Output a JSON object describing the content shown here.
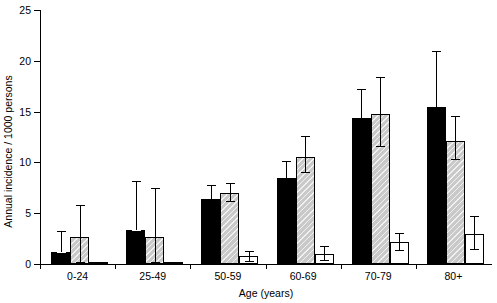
{
  "chart_data": {
    "type": "bar",
    "title": "",
    "xlabel": "Age (years)",
    "ylabel": "Annual incidence / 1000 persons",
    "categories": [
      "0-24",
      "25-49",
      "50-59",
      "60-69",
      "70-79",
      "80+"
    ],
    "ylim": [
      0,
      25
    ],
    "yticks": [
      0,
      5,
      10,
      15,
      20,
      25
    ],
    "ytick_labels": [
      "0",
      "5",
      "10",
      "15",
      "20",
      "25"
    ],
    "grid": false,
    "legend": "none",
    "series": [
      {
        "name": "series-1-black",
        "fill": "#000000",
        "values": [
          1.2,
          3.3,
          6.4,
          8.5,
          14.4,
          15.5
        ],
        "err_low": [
          1.2,
          3.3,
          5.7,
          7.5,
          13.0,
          13.2
        ],
        "err_high": [
          3.2,
          8.2,
          7.8,
          10.1,
          17.2,
          21.0
        ]
      },
      {
        "name": "series-2-gray-hatched",
        "fill": "#c9c9c9",
        "values": [
          2.7,
          2.7,
          7.0,
          10.5,
          14.8,
          12.1
        ],
        "err_low": [
          0.2,
          0.2,
          6.2,
          9.1,
          11.6,
          10.3
        ],
        "err_high": [
          5.8,
          7.5,
          8.0,
          12.6,
          18.4,
          14.6
        ]
      },
      {
        "name": "series-3-white",
        "fill": "#ffffff",
        "values": [
          0.1,
          0.15,
          0.8,
          1.0,
          2.2,
          3.0
        ],
        "err_low": [
          0.1,
          0.15,
          0.3,
          0.4,
          1.4,
          1.5
        ],
        "err_high": [
          0.1,
          0.15,
          1.3,
          1.8,
          3.1,
          4.7
        ]
      }
    ]
  },
  "axes": {
    "y_axis_label": "Annual incidence / 1000 persons",
    "x_axis_label": "Age (years)"
  }
}
